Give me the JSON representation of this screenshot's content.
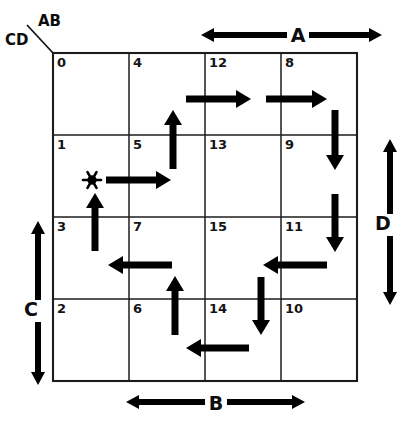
{
  "figure": {
    "type": "karnaugh-map-state-diagram",
    "grid": {
      "rows": 4,
      "cols": 4,
      "left": 53,
      "top": 53,
      "cell_w": 76,
      "cell_h": 82,
      "cells": [
        [
          {
            "id": "cell-0",
            "label": "0",
            "row": 0,
            "col": 0
          },
          {
            "id": "cell-4",
            "label": "4",
            "row": 0,
            "col": 1
          },
          {
            "id": "cell-12",
            "label": "12",
            "row": 0,
            "col": 2
          },
          {
            "id": "cell-8",
            "label": "8",
            "row": 0,
            "col": 3
          }
        ],
        [
          {
            "id": "cell-1",
            "label": "1",
            "row": 1,
            "col": 0
          },
          {
            "id": "cell-5",
            "label": "5",
            "row": 1,
            "col": 1
          },
          {
            "id": "cell-13",
            "label": "13",
            "row": 1,
            "col": 2
          },
          {
            "id": "cell-9",
            "label": "9",
            "row": 1,
            "col": 3
          }
        ],
        [
          {
            "id": "cell-3",
            "label": "3",
            "row": 2,
            "col": 0
          },
          {
            "id": "cell-7",
            "label": "7",
            "row": 2,
            "col": 1
          },
          {
            "id": "cell-15",
            "label": "15",
            "row": 2,
            "col": 2
          },
          {
            "id": "cell-11",
            "label": "11",
            "row": 2,
            "col": 3
          }
        ],
        [
          {
            "id": "cell-2",
            "label": "2",
            "row": 3,
            "col": 0
          },
          {
            "id": "cell-6",
            "label": "6",
            "row": 3,
            "col": 1
          },
          {
            "id": "cell-14",
            "label": "14",
            "row": 3,
            "col": 2
          },
          {
            "id": "cell-10",
            "label": "10",
            "row": 3,
            "col": 3
          }
        ]
      ]
    },
    "corner": {
      "top_label": "AB",
      "bottom_label": "CD"
    },
    "variable_spans": [
      {
        "id": "span-A",
        "label": "A",
        "orientation": "horizontal",
        "position": "top",
        "from": 201,
        "to": 382,
        "axis": 35,
        "label_x": 298,
        "label_y": 42
      },
      {
        "id": "span-B",
        "label": "B",
        "orientation": "horizontal",
        "position": "bottom",
        "from": 126,
        "to": 305,
        "axis": 402,
        "label_x": 216,
        "label_y": 410
      },
      {
        "id": "span-C",
        "label": "C",
        "orientation": "vertical",
        "position": "left",
        "from": 221,
        "to": 385,
        "axis": 38,
        "label_x": 31,
        "label_y": 316
      },
      {
        "id": "span-D",
        "label": "D",
        "orientation": "vertical",
        "position": "right",
        "from": 139,
        "to": 305,
        "axis": 390,
        "label_x": 383,
        "label_y": 230
      }
    ],
    "start_marker": {
      "id": "start-asterisk",
      "glyph": "*",
      "cell": "1",
      "x": 92,
      "y": 180
    },
    "transitions": [
      {
        "id": "t-3-1",
        "from": "3",
        "to": "1",
        "direction": "up",
        "x1": 95,
        "y1": 251,
        "x2": 95,
        "y2": 193
      },
      {
        "id": "t-1-5",
        "from": "1",
        "to": "5",
        "direction": "right",
        "x1": 106,
        "y1": 180,
        "x2": 171,
        "y2": 180
      },
      {
        "id": "t-5-4",
        "from": "5",
        "to": "4",
        "direction": "up",
        "x1": 173,
        "y1": 169,
        "x2": 173,
        "y2": 110
      },
      {
        "id": "t-4-12",
        "from": "4",
        "to": "12",
        "direction": "right",
        "x1": 186,
        "y1": 99,
        "x2": 251,
        "y2": 99
      },
      {
        "id": "t-12-8",
        "from": "12",
        "to": "8",
        "direction": "right",
        "x1": 266,
        "y1": 99,
        "x2": 327,
        "y2": 99
      },
      {
        "id": "t-8-9",
        "from": "8",
        "to": "9",
        "direction": "down",
        "x1": 335,
        "y1": 110,
        "x2": 335,
        "y2": 170
      },
      {
        "id": "t-9-11",
        "from": "9",
        "to": "11",
        "direction": "down",
        "x1": 335,
        "y1": 194,
        "x2": 335,
        "y2": 252
      },
      {
        "id": "t-11-15",
        "from": "11",
        "to": "15",
        "direction": "left",
        "x1": 327,
        "y1": 265,
        "x2": 263,
        "y2": 265
      },
      {
        "id": "t-15-14",
        "from": "15",
        "to": "14",
        "direction": "down",
        "x1": 261,
        "y1": 277,
        "x2": 261,
        "y2": 335
      },
      {
        "id": "t-14-6",
        "from": "14",
        "to": "6",
        "direction": "left",
        "x1": 249,
        "y1": 348,
        "x2": 186,
        "y2": 348
      },
      {
        "id": "t-6-7",
        "from": "6",
        "to": "7",
        "direction": "up",
        "x1": 175,
        "y1": 335,
        "x2": 175,
        "y2": 276
      },
      {
        "id": "t-7-3",
        "from": "7",
        "to": "3",
        "direction": "left",
        "x1": 172,
        "y1": 265,
        "x2": 108,
        "y2": 265
      }
    ]
  }
}
